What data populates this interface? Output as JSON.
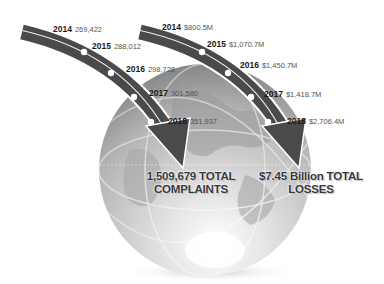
{
  "complaints": {
    "series": [
      {
        "year": "2014",
        "value": "269,422"
      },
      {
        "year": "2015",
        "value": "288,012"
      },
      {
        "year": "2016",
        "value": "298,728"
      },
      {
        "year": "2017",
        "value": "301,580"
      },
      {
        "year": "2018",
        "value": "351,937"
      }
    ],
    "total_line1": "1,509,679 TOTAL",
    "total_line2": "COMPLAINTS"
  },
  "losses": {
    "series": [
      {
        "year": "2014",
        "value": "$800.5M"
      },
      {
        "year": "2015",
        "value": "$1,070.7M"
      },
      {
        "year": "2016",
        "value": "$1,450.7M"
      },
      {
        "year": "2017",
        "value": "$1,418.7M"
      },
      {
        "year": "2018",
        "value": "$2,706.4M"
      }
    ],
    "total_line1": "$7.45 Billion TOTAL",
    "total_line2": "LOSSES"
  },
  "colors": {
    "arrow": "#4a4a4a",
    "globe_light": "#f2f2f2",
    "globe_dark": "#8c8c8c",
    "text": "#1a1a1a"
  }
}
